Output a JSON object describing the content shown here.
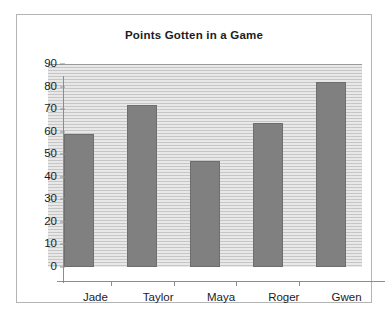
{
  "chart_data": {
    "type": "bar",
    "title": "Points Gotten in a Game",
    "xlabel": "",
    "ylabel": "",
    "categories": [
      "Jade",
      "Taylor",
      "Maya",
      "Roger",
      "Gwen"
    ],
    "values": [
      59,
      72,
      47,
      64,
      82
    ],
    "ylim": [
      0,
      90
    ],
    "yticks": [
      0,
      10,
      20,
      30,
      40,
      50,
      60,
      70,
      80,
      90
    ],
    "ytick_labels": [
      "0",
      "10",
      "20",
      "30",
      "40",
      "50",
      "60",
      "70",
      "80",
      "90"
    ],
    "grid": true,
    "grid_orientation": "horizontal",
    "legend": false,
    "legend_position": "none",
    "series": [
      {
        "name": "Points",
        "values": [
          59,
          72,
          47,
          64,
          82
        ]
      }
    ],
    "colors": {
      "bar_fill": "#808080",
      "bar_stroke": "#6e6e6e",
      "plot_background": "#d4d4d4",
      "gridline": "#c6c6c6",
      "axis": "#8c8c8c",
      "frame_border": "#b4b4b4",
      "text": "#1c1c1c",
      "page_background": "#ffffff"
    }
  }
}
